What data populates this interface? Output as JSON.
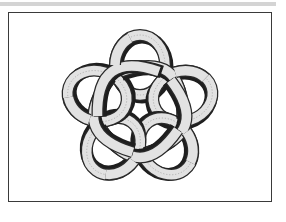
{
  "figure": {
    "type": "knot-diagram",
    "loop_count": 5,
    "colors": {
      "band_fill": "#e2e2e2",
      "band_outline": "#2a2a2a",
      "shadow": "#1e1e1e",
      "frame": "#3a3a3a",
      "top_bar": "#d4d4d4",
      "background": "#ffffff"
    }
  }
}
